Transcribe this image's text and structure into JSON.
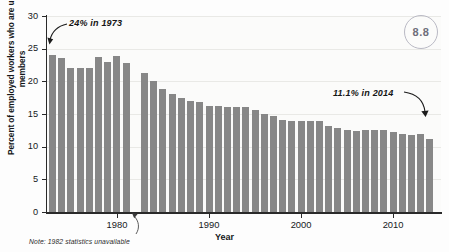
{
  "figure": {
    "badge_label": "8.8",
    "note": "Note: 1982 statistics unavailable"
  },
  "annotations": {
    "left": "24% in 1973",
    "right": "11.1% in 2014"
  },
  "chart_data": {
    "type": "bar",
    "title": "",
    "xlabel": "Year",
    "ylabel": "Percent of employed workers who are union members",
    "ylim": [
      0,
      30
    ],
    "yticks": [
      0,
      5,
      10,
      15,
      20,
      25,
      30
    ],
    "xticks": [
      1980,
      1990,
      2000,
      2010
    ],
    "xlim": [
      1972.4,
      2015.2
    ],
    "grid": "horizontal",
    "legend": "none",
    "bar_color": "#878787",
    "categories": [
      1973,
      1974,
      1975,
      1976,
      1977,
      1978,
      1979,
      1980,
      1981,
      1983,
      1984,
      1985,
      1986,
      1987,
      1988,
      1989,
      1990,
      1991,
      1992,
      1993,
      1994,
      1995,
      1996,
      1997,
      1998,
      1999,
      2000,
      2001,
      2002,
      2003,
      2004,
      2005,
      2006,
      2007,
      2008,
      2009,
      2010,
      2011,
      2012,
      2013,
      2014
    ],
    "values": [
      24.0,
      23.5,
      22.1,
      22.0,
      22.0,
      23.7,
      22.9,
      23.9,
      22.8,
      21.3,
      20.0,
      18.8,
      18.0,
      17.5,
      17.0,
      16.8,
      16.3,
      16.2,
      16.1,
      16.1,
      16.0,
      15.6,
      15.0,
      14.7,
      14.1,
      14.0,
      14.0,
      13.9,
      13.9,
      13.2,
      12.8,
      12.6,
      12.4,
      12.5,
      12.6,
      12.5,
      12.3,
      12.0,
      11.8,
      11.9,
      11.1
    ],
    "missing_years": [
      1982
    ],
    "notes": "1982 statistics unavailable"
  }
}
